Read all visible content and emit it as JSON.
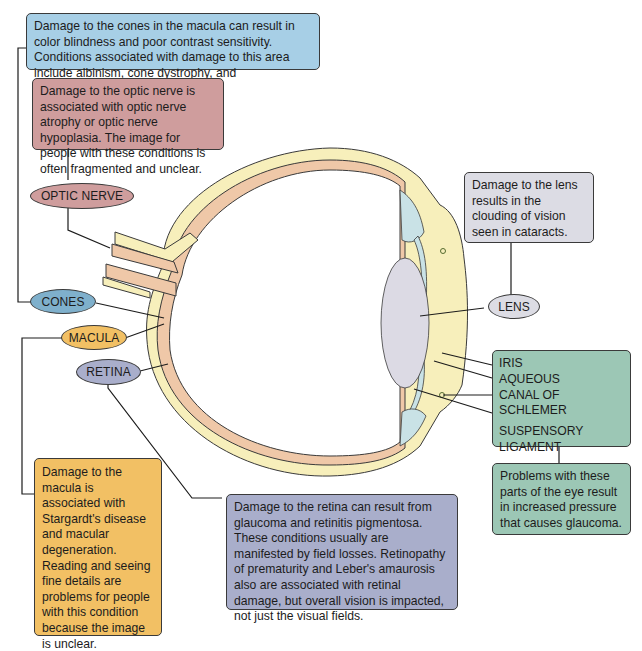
{
  "colors": {
    "cones": "#a7cfe6",
    "optic_nerve": "#cf9d9d",
    "lens": "#dcdce4",
    "glaucoma_parts": "#9cc7b5",
    "macula": "#f2c064",
    "retina": "#a9aecb",
    "sclera": "#f7efbb",
    "choroid_retina": "#efc8a8",
    "ciliary": "#c9e2e6",
    "lens_fill": "#dcdae4"
  },
  "callouts": {
    "cones": "Damage to the cones in the macula can result in color blindness and poor contrast sensitivity. Conditions associated with damage to this area include albinism, cone dystrophy, and achromatopsia.",
    "optic_nerve": "Damage to the optic nerve is associated with optic nerve atrophy or optic nerve hypoplasia. The image for people with these conditions is often fragmented and unclear.",
    "lens": "Damage to the lens results in the clouding of vision seen in cataracts.",
    "glaucoma": "Problems with these parts of the eye result in increased pressure that causes glaucoma.",
    "macula": "Damage to the macula is associated with Stargardt's disease and macular degeneration. Reading and seeing fine details are problems for people with this condition because the image is unclear.",
    "retina": "Damage to the retina can result from glaucoma and retinitis pigmentosa. These conditions usually are manifested by field losses. Retinopathy of prematurity and Leber's amaurosis also are associated with retinal damage, but overall vision is impacted, not just the visual fields."
  },
  "labels": {
    "optic_nerve": "OPTIC NERVE",
    "cones": "CONES",
    "macula": "MACULA",
    "retina": "RETINA",
    "lens": "LENS",
    "front_parts": [
      "IRIS",
      "AQUEOUS",
      "CANAL OF SCHLEMER",
      "SUSPENSORY",
      "LIGAMENT"
    ]
  }
}
